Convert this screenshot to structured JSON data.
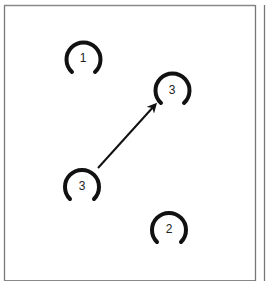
{
  "diagram": {
    "frame_color": "#888888",
    "ink_color": "#111111",
    "horseshoes": [
      {
        "label": "1",
        "cx": 83,
        "cy": 58
      },
      {
        "label": "3",
        "cx": 172,
        "cy": 89
      },
      {
        "label": "3",
        "cx": 82,
        "cy": 184
      },
      {
        "label": "2",
        "cx": 169,
        "cy": 228
      }
    ],
    "arrow": {
      "from": [
        98,
        168
      ],
      "to": [
        157,
        103
      ]
    }
  }
}
